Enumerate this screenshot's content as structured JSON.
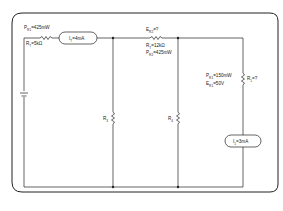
{
  "diagram": {
    "type": "circuit-schematic",
    "frame": "rounded-rectangle",
    "components": {
      "power": {
        "label_top": "P",
        "label_top_sub": "R1",
        "label_top_value": "=425mW"
      },
      "r_t": {
        "label": "R",
        "label_sub": "T",
        "label_value": "=5kΩ"
      },
      "ammeter_total": {
        "label": "I",
        "label_sub": "T",
        "label_value": "=4mA"
      },
      "r2_top": {
        "label": "E",
        "label_sub": "R2",
        "label_value": "=?"
      },
      "r_t2": {
        "label": "R",
        "label_sub": "T",
        "label_value": "=12kΩ"
      },
      "p_r2": {
        "label": "P",
        "label_sub": "R2",
        "label_value": "=425mW"
      },
      "r3": {
        "label": "R",
        "label_sub": "3"
      },
      "r4": {
        "label": "R",
        "label_sub": "4"
      },
      "p_r1": {
        "label": "P",
        "label_sub": "R1",
        "label_value": "=150mW"
      },
      "e_r1": {
        "label": "E",
        "label_sub": "R1",
        "label_value": "=50V"
      },
      "r1": {
        "label": "R",
        "label_sub": "1",
        "label_value": "=?"
      },
      "ammeter_1": {
        "label": "I",
        "label_sub": "1",
        "label_value": "=3mA"
      }
    },
    "colors": {
      "line": "#222222",
      "background": "#ffffff"
    }
  }
}
